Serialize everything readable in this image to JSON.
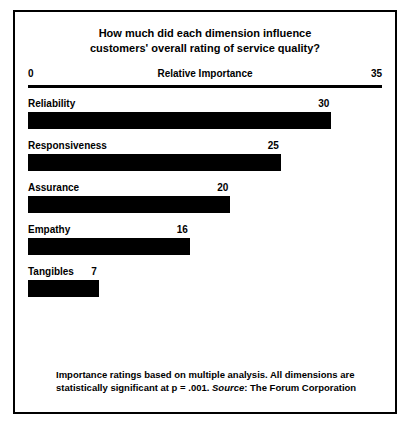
{
  "chart_data": {
    "type": "bar",
    "orientation": "horizontal",
    "title": "How much did each dimension influence customers' overall rating of service quality?",
    "title_lines": [
      "How much did each dimension influence",
      "customers' overall rating of service quality?"
    ],
    "xlabel": "Relative Importance",
    "ylabel": "",
    "xlim": [
      0,
      35
    ],
    "axis_min_label": "0",
    "axis_max_label": "35",
    "grid": false,
    "legend": null,
    "categories": [
      "Reliability",
      "Responsiveness",
      "Assurance",
      "Empathy",
      "Tangibles"
    ],
    "values": [
      30,
      25,
      20,
      16,
      7
    ],
    "bar_color": "#000000",
    "background_color": "#ffffff",
    "bars": [
      {
        "label": "Reliability",
        "value": 30,
        "value_label": "30"
      },
      {
        "label": "Responsiveness",
        "value": 25,
        "value_label": "25"
      },
      {
        "label": "Assurance",
        "value": 20,
        "value_label": "20"
      },
      {
        "label": "Empathy",
        "value": 16,
        "value_label": "16"
      },
      {
        "label": "Tangibles",
        "value": 7,
        "value_label": "7"
      }
    ],
    "annotations": {
      "footnote_line1": "Importance ratings based on multiple analysis. All dimensions  are",
      "footnote_line2_prefix": "statistically significant at p = .001. ",
      "footnote_source_label": "Source",
      "footnote_line2_suffix": ": The Forum Corporation"
    }
  }
}
